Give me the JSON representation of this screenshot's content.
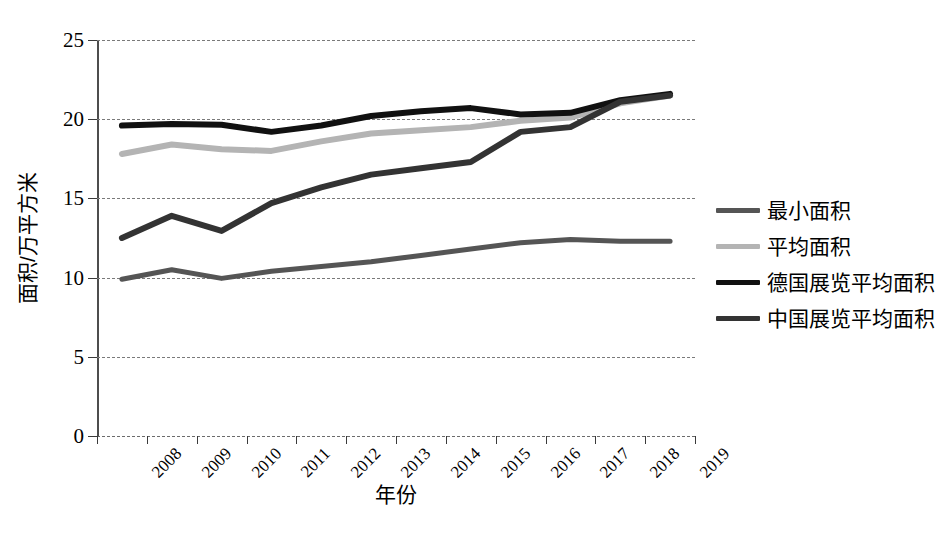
{
  "chart_data": {
    "type": "line",
    "title": "",
    "xlabel": "年份",
    "ylabel": "面积/万平方米",
    "categories": [
      "2008",
      "2009",
      "2010",
      "2011",
      "2012",
      "2013",
      "2014",
      "2015",
      "2016",
      "2017",
      "2018",
      "2019"
    ],
    "xlim": [
      0,
      11
    ],
    "ylim": [
      0,
      25
    ],
    "yticks": [
      0,
      5,
      10,
      15,
      20,
      25
    ],
    "grid": true,
    "legend_position": "right",
    "series": [
      {
        "name": "最小面积",
        "color": "#555555",
        "width": 5,
        "values": [
          9.9,
          10.5,
          9.95,
          10.4,
          10.7,
          11.0,
          11.4,
          11.8,
          12.2,
          12.4,
          12.3,
          12.3
        ]
      },
      {
        "name": "平均面积",
        "color": "#b4b4b4",
        "width": 6,
        "values": [
          17.8,
          18.4,
          18.1,
          18.0,
          18.6,
          19.1,
          19.3,
          19.5,
          19.9,
          20.1,
          21.0,
          21.5
        ]
      },
      {
        "name": "德国展览平均面积",
        "color": "#111111",
        "width": 6,
        "values": [
          19.6,
          19.7,
          19.65,
          19.2,
          19.6,
          20.2,
          20.5,
          20.7,
          20.3,
          20.4,
          21.2,
          21.6
        ]
      },
      {
        "name": "中国展览平均面积",
        "color": "#333333",
        "width": 6,
        "values": [
          12.5,
          13.9,
          12.95,
          14.7,
          15.7,
          16.5,
          16.9,
          17.3,
          19.2,
          19.5,
          21.1,
          21.5
        ]
      }
    ]
  },
  "legend": {
    "items": [
      {
        "label": "最小面积"
      },
      {
        "label": "平均面积"
      },
      {
        "label": "德国展览平均面积"
      },
      {
        "label": "中国展览平均面积"
      }
    ]
  },
  "axes": {
    "y_title": "面积/万平方米",
    "x_title": "年份",
    "y_tick_labels": [
      "0",
      "5",
      "10",
      "15",
      "20",
      "25"
    ],
    "x_tick_labels": [
      "2008",
      "2009",
      "2010",
      "2011",
      "2012",
      "2013",
      "2014",
      "2015",
      "2016",
      "2017",
      "2018",
      "2019"
    ]
  }
}
